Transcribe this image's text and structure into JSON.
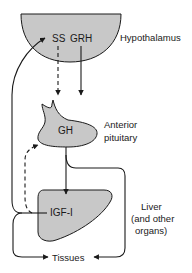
{
  "diagram": {
    "type": "endocrine-feedback-axis",
    "colors": {
      "organ_fill": "#c8c8c8",
      "stroke": "#1a1a1a",
      "background": "#ffffff"
    },
    "organs": {
      "hypothalamus": {
        "label": "Hypothalamus",
        "hormones": [
          "SS",
          "GRH"
        ]
      },
      "pituitary": {
        "label_line1": "Anterior",
        "label_line2": "pituitary",
        "hormone": "GH"
      },
      "liver": {
        "label_line1": "Liver",
        "label_line2": "(and other",
        "label_line3": "organs)",
        "hormone": "IGF-I"
      },
      "tissues": {
        "label": "Tissues"
      }
    },
    "hormone_labels": {
      "ss": "SS",
      "grh": "GRH",
      "gh": "GH",
      "igf1": "IGF-I"
    },
    "edges": [
      {
        "from": "SS",
        "to": "Anterior pituitary",
        "style": "dashed",
        "meaning": "inhibition"
      },
      {
        "from": "GRH",
        "to": "Anterior pituitary",
        "style": "solid",
        "meaning": "stimulation"
      },
      {
        "from": "GH",
        "to": "Liver",
        "style": "solid"
      },
      {
        "from": "GH",
        "to": "Tissues",
        "style": "solid"
      },
      {
        "from": "IGF-I",
        "to": "SS",
        "style": "solid",
        "meaning": "feedback"
      },
      {
        "from": "IGF-I",
        "to": "Anterior pituitary",
        "style": "dashed",
        "meaning": "feedback"
      },
      {
        "from": "IGF-I",
        "to": "Tissues",
        "style": "solid"
      }
    ]
  }
}
